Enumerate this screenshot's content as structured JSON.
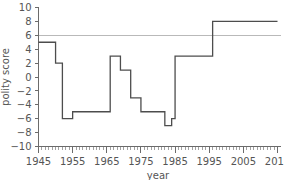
{
  "chart_data": {
    "type": "line",
    "title": "",
    "xlabel": "year",
    "ylabel": "polity score",
    "xlim": [
      1945,
      2015
    ],
    "ylim": [
      -10,
      10
    ],
    "grid": false,
    "legend": null,
    "x_ticks": [
      1945,
      1955,
      1965,
      1975,
      1985,
      1995,
      2005,
      2015
    ],
    "x_tick_labels": [
      "1945",
      "1955",
      "1965",
      "1975",
      "1985",
      "1995",
      "2005",
      "2015"
    ],
    "x_minor_tick_step": 1,
    "y_ticks": [
      -10,
      -8,
      -6,
      -4,
      -2,
      0,
      2,
      4,
      6,
      8,
      10
    ],
    "y_tick_labels": [
      "−10",
      "−8",
      "−6",
      "−4",
      "−2",
      "0",
      "2",
      "4",
      "6",
      "8",
      "10"
    ],
    "series": [
      {
        "name": "polity score",
        "drawstyle": "steps-post",
        "color": "#4d4d4d",
        "x": [
          1945,
          1950,
          1952,
          1955,
          1957,
          1966,
          1968,
          1972,
          1974,
          1977,
          1980,
          1983,
          1985,
          1986,
          1996,
          2015
        ],
        "values": [
          5,
          2,
          2,
          -6,
          -5,
          -5,
          3,
          1,
          -3,
          -5,
          -5,
          -7,
          -6,
          3,
          8,
          8
        ],
        "points": [
          {
            "x": 1945,
            "y": 5
          },
          {
            "x": 1950,
            "y": 5
          },
          {
            "x": 1950,
            "y": 2
          },
          {
            "x": 1952,
            "y": 2
          },
          {
            "x": 1952,
            "y": -6
          },
          {
            "x": 1955,
            "y": -6
          },
          {
            "x": 1955,
            "y": -5
          },
          {
            "x": 1966,
            "y": -5
          },
          {
            "x": 1966,
            "y": 3
          },
          {
            "x": 1969,
            "y": 3
          },
          {
            "x": 1969,
            "y": 1
          },
          {
            "x": 1972,
            "y": 1
          },
          {
            "x": 1972,
            "y": -3
          },
          {
            "x": 1975,
            "y": -3
          },
          {
            "x": 1975,
            "y": -5
          },
          {
            "x": 1982,
            "y": -5
          },
          {
            "x": 1982,
            "y": -7
          },
          {
            "x": 1984,
            "y": -7
          },
          {
            "x": 1984,
            "y": -6
          },
          {
            "x": 1985,
            "y": -6
          },
          {
            "x": 1985,
            "y": 3
          },
          {
            "x": 1996,
            "y": 3
          },
          {
            "x": 1996,
            "y": 8
          },
          {
            "x": 2015,
            "y": 8
          }
        ]
      }
    ],
    "reference_lines": [
      {
        "name": "democracy-threshold",
        "orientation": "horizontal",
        "y": 6,
        "color": "#b9b9b9"
      }
    ]
  }
}
